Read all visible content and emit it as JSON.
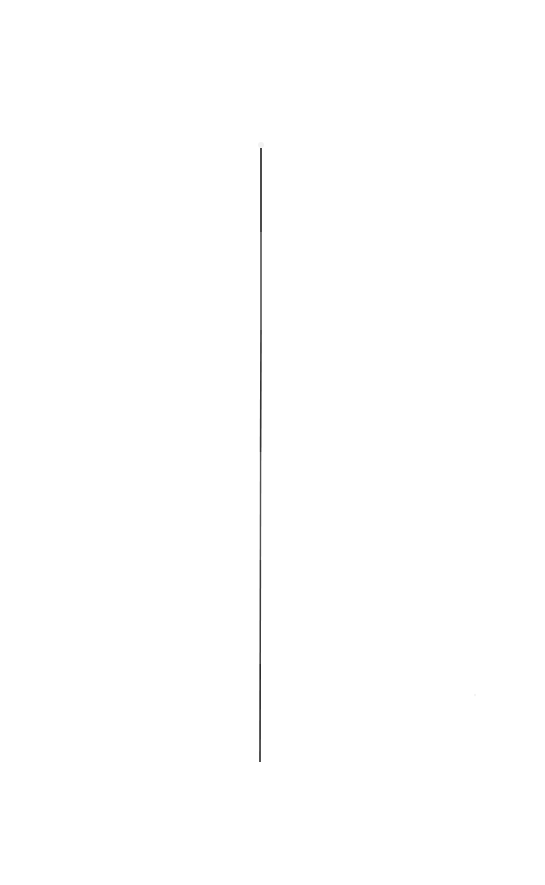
{
  "canvas": {
    "width": 545,
    "height": 885,
    "background_color": "#ffffff",
    "description": "Blank white page containing a single thin near-vertical dark line."
  },
  "figure": {
    "name": "vertical-line",
    "stroke_color": "#2b2b2b",
    "stroke_color_light": "#585858",
    "stroke_width_px": 1.6,
    "orientation": "vertical",
    "top_point": {
      "x": 261,
      "y": 148
    },
    "bottom_point": {
      "x": 260,
      "y": 762
    },
    "length_px": 614,
    "tilt_px": -1,
    "segments": [
      {
        "x1": 261,
        "y1": 148,
        "x2": 261,
        "y2": 232,
        "opacity": 1.0,
        "width": 1.7
      },
      {
        "x1": 261,
        "y1": 232,
        "x2": 261,
        "y2": 330,
        "opacity": 0.88,
        "width": 1.5
      },
      {
        "x1": 261,
        "y1": 330,
        "x2": 260.6,
        "y2": 452,
        "opacity": 0.95,
        "width": 1.6
      },
      {
        "x1": 260.6,
        "y1": 452,
        "x2": 260.4,
        "y2": 560,
        "opacity": 0.82,
        "width": 1.4
      },
      {
        "x1": 260.4,
        "y1": 560,
        "x2": 260.2,
        "y2": 664,
        "opacity": 0.92,
        "width": 1.5
      },
      {
        "x1": 260.2,
        "y1": 664,
        "x2": 260,
        "y2": 762,
        "opacity": 1.0,
        "width": 1.6
      }
    ],
    "speck": {
      "x": 475,
      "y": 695,
      "radius": 1.2,
      "opacity": 0.05
    },
    "tip_artifact": {
      "x": 261,
      "y": 145,
      "opacity": 0.06
    }
  },
  "annotations": {
    "title": "",
    "caption": "",
    "labels": []
  },
  "chart_data": {
    "type": "line",
    "title": "",
    "xlabel": "",
    "ylabel": "",
    "series": [
      {
        "name": "vertical-line",
        "x": [
          261,
          261,
          261,
          260.6,
          260.4,
          260.2,
          260
        ],
        "y": [
          148,
          232,
          330,
          452,
          560,
          664,
          762
        ]
      }
    ],
    "xlim": [
      0,
      545
    ],
    "ylim": [
      885,
      0
    ],
    "grid": false,
    "legend": "none",
    "axes_visible": false
  }
}
